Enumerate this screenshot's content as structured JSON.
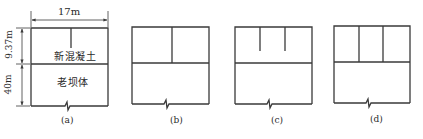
{
  "figure": {
    "panels": [
      {
        "id": "a",
        "caption": "(a)",
        "label_upper": "新混凝土",
        "label_lower": "老坝体",
        "dimension_width": "17m",
        "dimension_upper_height": "9.37m",
        "dimension_lower_height": "40m",
        "description": "Single partial vertical joint from top into new concrete"
      },
      {
        "id": "b",
        "caption": "(b)",
        "description": "One full-depth vertical joint dividing new concrete into two blocks"
      },
      {
        "id": "c",
        "caption": "(c)",
        "description": "Two partial vertical joints from top into new concrete"
      },
      {
        "id": "d",
        "caption": "(d)",
        "description": "Two full-depth vertical joints dividing new concrete into three blocks"
      }
    ],
    "line_color": "#3a3a3a",
    "background": "#ffffff"
  }
}
